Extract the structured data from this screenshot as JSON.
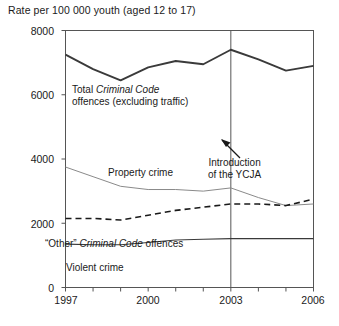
{
  "figure": {
    "axis_title": "Rate per 100 000 youth (aged 12 to 17)"
  },
  "annotations": {
    "total_line1_a": "Total ",
    "total_line1_b": "Criminal Code",
    "total_line2": "offences (excluding traffic)",
    "property": "Property crime",
    "other_a": "“Other” ",
    "other_b": "Criminal Code",
    "other_c": " offences",
    "violent": "Violent crime",
    "ycja_line1": "Introduction",
    "ycja_line2": "of the YCJA"
  },
  "chart_data": {
    "type": "line",
    "title": "",
    "xlabel": "",
    "ylabel": "Rate per 100 000 youth (aged 12 to 17)",
    "x": [
      1997,
      1998,
      1999,
      2000,
      2001,
      2002,
      2003,
      2004,
      2005,
      2006
    ],
    "xlim": [
      1997,
      2006
    ],
    "ylim": [
      0,
      8000
    ],
    "yticks": [
      0,
      2000,
      4000,
      6000,
      8000
    ],
    "ytick_labels": [
      "0",
      "2000",
      "4000",
      "6000",
      "8000"
    ],
    "xticks": [
      1997,
      1998,
      1999,
      2000,
      2001,
      2002,
      2003,
      2004,
      2005,
      2006
    ],
    "xtick_labels": [
      "1997",
      "",
      "",
      "2000",
      "",
      "",
      "2003",
      "",
      "",
      "2006"
    ],
    "grid": false,
    "legend": "inline-labels",
    "vertical_reference_line": {
      "x": 2003,
      "label": "Introduction of the YCJA"
    },
    "series": [
      {
        "name": "Total Criminal Code offences (excluding traffic)",
        "style": "solid-thick",
        "color": "#3a3a3a",
        "values": [
          7250,
          6800,
          6450,
          6850,
          7050,
          6950,
          7400,
          7100,
          6750,
          6900
        ]
      },
      {
        "name": "Property crime",
        "style": "solid-thin",
        "color": "#8a8a8a",
        "values": [
          3750,
          3450,
          3150,
          3050,
          3050,
          3000,
          3100,
          2800,
          2550,
          2600
        ]
      },
      {
        "name": "“Other” Criminal Code offences",
        "style": "dashed",
        "color": "#1a1a1a",
        "values": [
          2150,
          2150,
          2100,
          2250,
          2400,
          2500,
          2600,
          2600,
          2550,
          2750
        ]
      },
      {
        "name": "Violent crime",
        "style": "solid-thin-dark",
        "color": "#3a3a3a",
        "values": [
          1350,
          1330,
          1330,
          1400,
          1480,
          1500,
          1520,
          1520,
          1520,
          1520
        ]
      }
    ]
  }
}
